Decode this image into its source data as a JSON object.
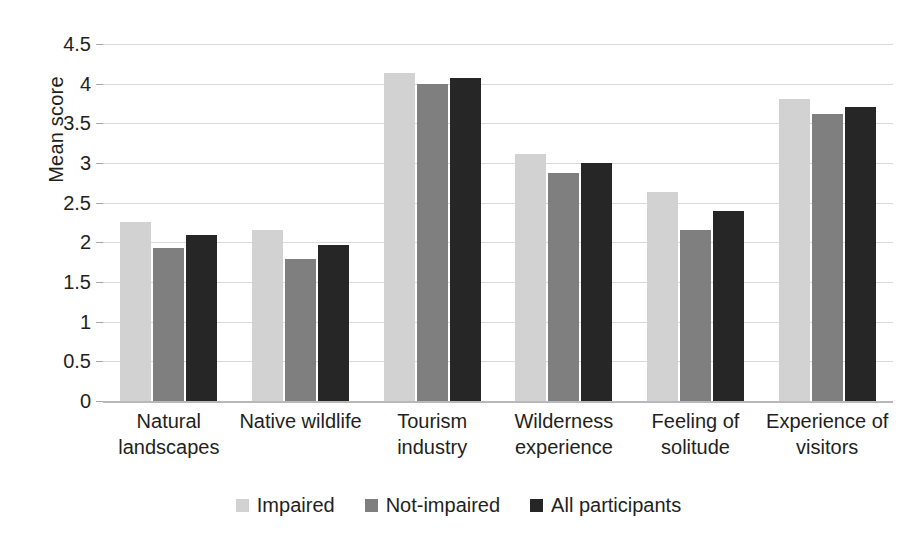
{
  "chart_data": {
    "type": "bar",
    "title": "",
    "xlabel": "",
    "ylabel": "Mean score",
    "ylim": [
      0,
      4.5
    ],
    "yticks": [
      "0",
      "0.5",
      "1",
      "1.5",
      "2",
      "2.5",
      "3",
      "3.5",
      "4",
      "4.5"
    ],
    "grid": true,
    "legend_position": "bottom",
    "categories": [
      "Natural landscapes",
      "Native wildlife",
      "Tourism industry",
      "Wilderness experience",
      "Feeling of solitude",
      "Experience of visitors"
    ],
    "series": [
      {
        "name": "Impaired",
        "color": "#d2d2d2",
        "values": [
          2.26,
          2.16,
          4.13,
          3.11,
          2.64,
          3.81
        ]
      },
      {
        "name": "Not-impaired",
        "color": "#7f7f7f",
        "values": [
          1.93,
          1.79,
          4.0,
          2.87,
          2.16,
          3.62
        ]
      },
      {
        "name": "All participants",
        "color": "#262626",
        "values": [
          2.09,
          1.97,
          4.07,
          3.0,
          2.4,
          3.7
        ]
      }
    ]
  }
}
